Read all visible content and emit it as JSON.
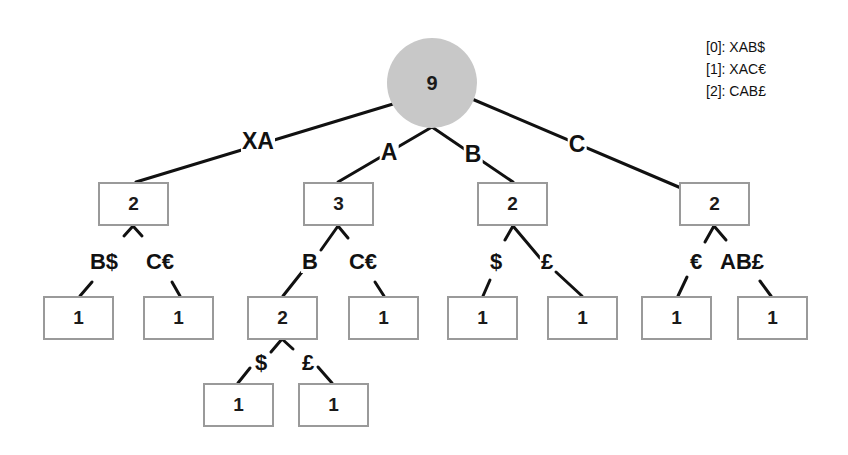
{
  "legend": {
    "lines": [
      "[0]: XAB$",
      "[1]: XAC€",
      "[2]: CAB£"
    ]
  },
  "root": {
    "count": "9",
    "fill": "#c8c8c8"
  },
  "level1": [
    {
      "edge": "XA",
      "count": "2"
    },
    {
      "edge": "A",
      "count": "3"
    },
    {
      "edge": "B",
      "count": "2"
    },
    {
      "edge": "C",
      "count": "2"
    }
  ],
  "level2": [
    {
      "parent": "XA",
      "edge": "B$",
      "count": "1"
    },
    {
      "parent": "XA",
      "edge": "C€",
      "count": "1"
    },
    {
      "parent": "A",
      "edge": "B",
      "count": "2"
    },
    {
      "parent": "A",
      "edge": "C€",
      "count": "1"
    },
    {
      "parent": "B",
      "edge": "$",
      "count": "1"
    },
    {
      "parent": "B",
      "edge": "£",
      "count": "1"
    },
    {
      "parent": "C",
      "edge": "€",
      "count": "1"
    },
    {
      "parent": "C",
      "edge": "AB£",
      "count": "1"
    }
  ],
  "level3": [
    {
      "parent": "AB",
      "edge": "$",
      "count": "1"
    },
    {
      "parent": "AB",
      "edge": "£",
      "count": "1"
    }
  ],
  "colors": {
    "edge": "#111111",
    "box_border": "#9a9a9a",
    "root_fill": "#c8c8c8"
  }
}
